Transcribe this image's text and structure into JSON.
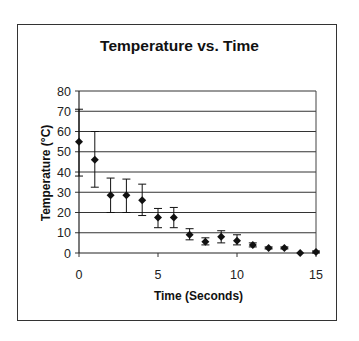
{
  "chart_data": {
    "type": "scatter",
    "title": "Temperature vs. Time",
    "xlabel": "Time (Seconds)",
    "ylabel": "Temperature (°C)",
    "xlim": [
      0,
      15
    ],
    "ylim": [
      0,
      80
    ],
    "x_ticks": [
      0,
      5,
      10,
      15
    ],
    "y_ticks": [
      0,
      10,
      20,
      30,
      40,
      50,
      60,
      70,
      80
    ],
    "grid": "horizontal",
    "legend": "none",
    "marker": "diamond",
    "series": [
      {
        "name": "Temperature",
        "x": [
          0,
          1,
          2,
          3,
          4,
          5,
          6,
          7,
          8,
          9,
          10,
          11,
          12,
          13,
          14,
          15
        ],
        "values": [
          55,
          46,
          28.5,
          28.5,
          26,
          17.5,
          17.5,
          9,
          5.5,
          8,
          6,
          4,
          2.5,
          2.5,
          0,
          0.5
        ],
        "error_low": [
          38,
          32.5,
          20,
          20,
          18.5,
          12.5,
          12.5,
          6.5,
          4,
          5,
          4,
          3,
          2,
          2,
          0,
          0
        ],
        "error_high": [
          71,
          60,
          37,
          36.5,
          34,
          22,
          22.5,
          12,
          7.5,
          11,
          9,
          5,
          3,
          3,
          0,
          1
        ]
      }
    ]
  },
  "labels": {
    "title": "Temperature vs. Time",
    "xlabel": "Time (Seconds)",
    "ylabel": "Temperature (°C)"
  }
}
